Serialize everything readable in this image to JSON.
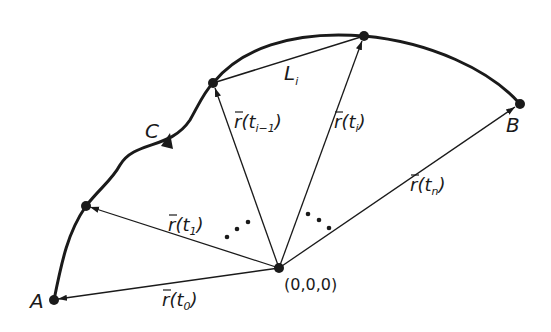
{
  "diagram": {
    "origin": {
      "label": "(0,0,0)"
    },
    "curve": {
      "label": "C"
    },
    "points": {
      "A": {
        "label": "A"
      },
      "B": {
        "label": "B"
      }
    },
    "chord": {
      "label": "L",
      "subscript": "i"
    },
    "vectors": [
      {
        "name": "r",
        "param": "t",
        "subscript": "0"
      },
      {
        "name": "r",
        "param": "t",
        "subscript": "1"
      },
      {
        "name": "r",
        "param": "t",
        "subscript": "i−1"
      },
      {
        "name": "r",
        "param": "t",
        "subscript": "i"
      },
      {
        "name": "r",
        "param": "t",
        "subscript": "n"
      }
    ],
    "ellipsis": "..."
  }
}
